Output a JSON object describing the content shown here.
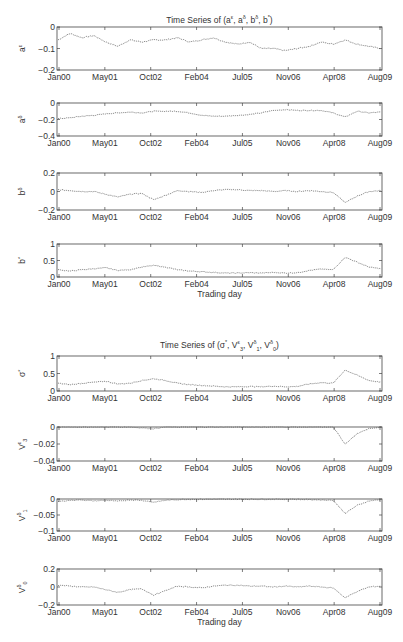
{
  "figure_titles": {
    "top": {
      "prefix": "Time Series of (",
      "parts": [
        [
          "a",
          "ε"
        ],
        [
          "a",
          "δ"
        ],
        [
          "b",
          "δ"
        ],
        [
          "b",
          "*"
        ]
      ],
      "suffix": ")"
    },
    "bottom": {
      "prefix": "Time Series of (",
      "parts": [
        [
          "σ",
          "*",
          ""
        ],
        [
          "V",
          "ε",
          "3"
        ],
        [
          "V",
          "δ",
          "1"
        ],
        [
          "V",
          "δ",
          "0"
        ]
      ],
      "suffix": ")"
    }
  },
  "xticks": [
    "Jan00",
    "May01",
    "Oct02",
    "Feb04",
    "Jul05",
    "Nov06",
    "Apr08",
    "Aug09"
  ],
  "xlabel": "Trading day",
  "chart_data": [
    {
      "type": "line",
      "title": "Time Series of (a^ε, a^δ, b^δ, b^*)",
      "ylabel": "a^ε",
      "ylim": [
        -0.2,
        0
      ],
      "yticks": [
        "0",
        "-0.1",
        "-0.2"
      ],
      "top": 27,
      "bottom": 70,
      "x": [
        "Jan00",
        "May01",
        "Oct02",
        "Feb04",
        "Jul05",
        "Nov06",
        "Apr08",
        "Aug09"
      ],
      "values": [
        -0.06,
        -0.03,
        -0.05,
        -0.04,
        -0.07,
        -0.09,
        -0.06,
        -0.07,
        -0.06,
        -0.06,
        -0.05,
        -0.07,
        -0.06,
        -0.05,
        -0.07,
        -0.08,
        -0.07,
        -0.1,
        -0.1,
        -0.11,
        -0.1,
        -0.09,
        -0.07,
        -0.08,
        -0.06,
        -0.08,
        -0.09,
        -0.1
      ]
    },
    {
      "type": "line",
      "ylabel": "a^δ",
      "ylim": [
        -0.4,
        0
      ],
      "yticks": [
        "0",
        "-0.2",
        "-0.4"
      ],
      "top": 103,
      "bottom": 136,
      "values": [
        -0.19,
        -0.18,
        -0.16,
        -0.15,
        -0.13,
        -0.12,
        -0.11,
        -0.12,
        -0.1,
        -0.1,
        -0.1,
        -0.12,
        -0.15,
        -0.16,
        -0.16,
        -0.15,
        -0.14,
        -0.12,
        -0.09,
        -0.08,
        -0.09,
        -0.09,
        -0.09,
        -0.12,
        -0.17,
        -0.1,
        -0.12,
        -0.11
      ]
    },
    {
      "type": "line",
      "ylabel": "b^δ",
      "ylim": [
        -0.2,
        0.2
      ],
      "yticks": [
        "0.2",
        "0",
        "-0.2"
      ],
      "top": 173,
      "bottom": 210,
      "values": [
        0.02,
        0.01,
        0.0,
        0.0,
        -0.03,
        -0.06,
        -0.03,
        -0.02,
        -0.09,
        -0.04,
        0.01,
        0.0,
        -0.01,
        0.01,
        0.02,
        0.02,
        0.01,
        0.01,
        0.0,
        0.01,
        0.0,
        0.01,
        0.0,
        -0.01,
        -0.12,
        -0.05,
        0.0,
        0.01
      ]
    },
    {
      "type": "line",
      "ylabel": "b^*",
      "ylim": [
        0,
        1
      ],
      "yticks": [
        "1",
        "0.5",
        "0"
      ],
      "top": 244,
      "bottom": 277,
      "xlabel": "Trading day",
      "values": [
        0.22,
        0.18,
        0.22,
        0.25,
        0.28,
        0.2,
        0.22,
        0.3,
        0.35,
        0.3,
        0.22,
        0.18,
        0.16,
        0.14,
        0.12,
        0.12,
        0.13,
        0.12,
        0.14,
        0.12,
        0.13,
        0.2,
        0.24,
        0.22,
        0.6,
        0.45,
        0.3,
        0.25
      ]
    },
    {
      "type": "line",
      "title": "Time Series of (σ^*, V^ε_3, V^δ_1, V^δ_0)",
      "ylabel": "σ^*",
      "ylim": [
        0,
        1
      ],
      "yticks": [
        "1",
        "0.5",
        "0"
      ],
      "top": 356,
      "bottom": 391,
      "values": [
        0.22,
        0.18,
        0.22,
        0.25,
        0.28,
        0.2,
        0.22,
        0.3,
        0.35,
        0.3,
        0.22,
        0.18,
        0.16,
        0.14,
        0.12,
        0.12,
        0.13,
        0.12,
        0.14,
        0.12,
        0.13,
        0.2,
        0.24,
        0.22,
        0.6,
        0.45,
        0.3,
        0.25
      ]
    },
    {
      "type": "line",
      "ylabel": "V^ε_3",
      "ylim": [
        -0.04,
        0
      ],
      "yticks": [
        "0",
        "-0.02",
        "-0.04"
      ],
      "top": 427,
      "bottom": 461,
      "values": [
        0,
        0,
        0,
        0,
        0,
        0,
        0,
        -0.001,
        -0.002,
        0,
        0,
        0,
        0,
        0,
        0,
        0,
        0,
        0,
        0,
        0,
        0,
        0,
        0,
        0,
        -0.02,
        -0.008,
        -0.002,
        0
      ]
    },
    {
      "type": "line",
      "ylabel": "V^δ_1",
      "ylim": [
        -0.1,
        0
      ],
      "yticks": [
        "0",
        "-0.05",
        "-0.1"
      ],
      "top": 499,
      "bottom": 531,
      "values": [
        -0.008,
        -0.004,
        -0.003,
        -0.006,
        -0.004,
        -0.007,
        -0.003,
        -0.004,
        -0.01,
        -0.004,
        -0.002,
        -0.001,
        -0.001,
        -0.001,
        -0.001,
        -0.001,
        -0.001,
        -0.001,
        -0.001,
        -0.001,
        -0.001,
        -0.002,
        -0.003,
        -0.004,
        -0.045,
        -0.02,
        -0.006,
        -0.002
      ]
    },
    {
      "type": "line",
      "ylabel": "V^δ_0",
      "ylim": [
        -0.2,
        0.2
      ],
      "yticks": [
        "0.2",
        "0",
        "-0.2"
      ],
      "top": 569,
      "bottom": 605,
      "xlabel": "Trading day",
      "values": [
        0.02,
        0.01,
        0.0,
        0.0,
        -0.03,
        -0.06,
        -0.03,
        -0.02,
        -0.09,
        -0.04,
        0.01,
        0.0,
        -0.01,
        0.01,
        0.02,
        0.02,
        0.01,
        0.01,
        0.0,
        0.01,
        0.0,
        0.01,
        0.0,
        -0.01,
        -0.12,
        -0.05,
        0.0,
        0.01
      ]
    }
  ]
}
